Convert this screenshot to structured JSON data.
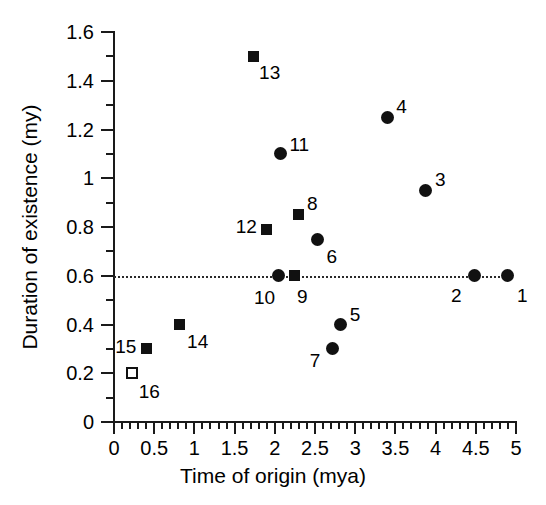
{
  "chart_data": {
    "type": "scatter",
    "title": "",
    "xlabel": "Time of origin (mya)",
    "ylabel": "Duration of existence (my)",
    "xlim": [
      0,
      5
    ],
    "ylim": [
      0,
      1.6
    ],
    "xticks": [
      "0",
      "0.5",
      "1",
      "1.5",
      "2",
      "2.5",
      "3",
      "3.5",
      "4",
      "4.5",
      "5"
    ],
    "xtick_values": [
      0,
      0.5,
      1,
      1.5,
      2,
      2.5,
      3,
      3.5,
      4,
      4.5,
      5
    ],
    "ytick_values": [
      0,
      0.2,
      0.4,
      0.6,
      0.8,
      1,
      1.2,
      1.4,
      1.6
    ],
    "yticks": [
      "0",
      "0.2",
      "0.4",
      "0.6",
      "0.8",
      "1",
      "1.2",
      "1.4",
      "1.6"
    ],
    "x_minor_step": 0.1,
    "y_minor_step": 0.1,
    "grid": false,
    "legend": null,
    "reference_line": {
      "orientation": "horizontal",
      "value": 0.6,
      "style": "dotted",
      "color": "#2a2a2a",
      "x_start": 0.0,
      "x_end": 4.95
    },
    "marker_styles": {
      "circle": "filled circle",
      "square-filled": "filled square",
      "square-open": "open square"
    },
    "points": [
      {
        "label": "1",
        "x": 4.9,
        "y": 0.6,
        "marker": "circle",
        "label_dx": 9,
        "label_dy": 10
      },
      {
        "label": "2",
        "x": 4.49,
        "y": 0.6,
        "marker": "circle",
        "label_dx": -24,
        "label_dy": 10
      },
      {
        "label": "3",
        "x": 3.88,
        "y": 0.95,
        "marker": "circle",
        "label_dx": 9,
        "label_dy": -20
      },
      {
        "label": "4",
        "x": 3.4,
        "y": 1.25,
        "marker": "circle",
        "label_dx": 9,
        "label_dy": -20
      },
      {
        "label": "5",
        "x": 2.82,
        "y": 0.4,
        "marker": "circle",
        "label_dx": 9,
        "label_dy": -20
      },
      {
        "label": "6",
        "x": 2.53,
        "y": 0.75,
        "marker": "circle",
        "label_dx": 9,
        "label_dy": 8
      },
      {
        "label": "7",
        "x": 2.72,
        "y": 0.3,
        "marker": "circle",
        "label_dx": -23,
        "label_dy": 2
      },
      {
        "label": "8",
        "x": 2.3,
        "y": 0.85,
        "marker": "square-filled",
        "label_dx": 8,
        "label_dy": -21
      },
      {
        "label": "9",
        "x": 2.24,
        "y": 0.6,
        "marker": "square-filled",
        "label_dx": 3,
        "label_dy": 11
      },
      {
        "label": "10",
        "x": 2.04,
        "y": 0.6,
        "marker": "circle",
        "label_dx": -24,
        "label_dy": 12
      },
      {
        "label": "11",
        "x": 2.07,
        "y": 1.1,
        "marker": "circle",
        "label_dx": 9,
        "label_dy": -19
      },
      {
        "label": "12",
        "x": 1.9,
        "y": 0.79,
        "marker": "square-filled",
        "label_dx": -31,
        "label_dy": -12
      },
      {
        "label": "13",
        "x": 1.73,
        "y": 1.5,
        "marker": "square-filled",
        "label_dx": 6,
        "label_dy": 7
      },
      {
        "label": "14",
        "x": 0.81,
        "y": 0.4,
        "marker": "square-filled",
        "label_dx": 8,
        "label_dy": 7
      },
      {
        "label": "15",
        "x": 0.4,
        "y": 0.3,
        "marker": "square-filled",
        "label_dx": -31,
        "label_dy": -12
      },
      {
        "label": "16",
        "x": 0.22,
        "y": 0.2,
        "marker": "square-open",
        "label_dx": 7,
        "label_dy": 9
      }
    ]
  }
}
